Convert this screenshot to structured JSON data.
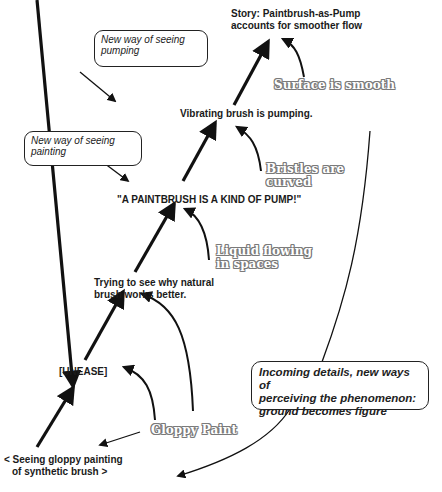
{
  "diagram": {
    "type": "concept-flow",
    "nodes": {
      "story": {
        "line1": "Story: Paintbrush-as-Pump",
        "line2": "accounts for smoother flow"
      },
      "vibrating": "Vibrating brush is pumping.",
      "pump": "\"A PAINTBRUSH IS A KIND OF PUMP!\"",
      "trying": {
        "line1": "Trying to see why natural",
        "line2": "brush works better."
      },
      "unease": "[UNEASE]",
      "seeing": {
        "line1": "< Seeing gloppy painting",
        "line2": "of synthetic brush >"
      }
    },
    "details": {
      "surface": "Surface is smooth",
      "bristles": {
        "line1": "Bristles are",
        "line2": "curved"
      },
      "liquid": {
        "line1": "Liquid flowing",
        "line2": "in spaces"
      },
      "gloppy": "Gloppy Paint"
    },
    "callouts": {
      "pumping": {
        "line1": "New way of seeing",
        "line2": "pumping"
      },
      "painting": {
        "line1": "New way of seeing",
        "line2": "painting"
      },
      "incoming": {
        "line1": "Incoming details, new ways of",
        "line2": "perceiving the phenomenon:",
        "line3": "ground becomes figure"
      }
    }
  }
}
